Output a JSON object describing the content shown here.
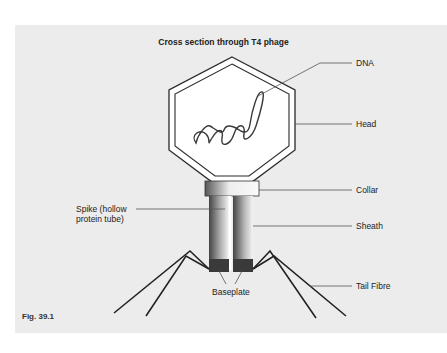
{
  "figure": {
    "title": "Cross section through T4 phage",
    "caption": "Fig. 39.1"
  },
  "labels": {
    "dna": "DNA",
    "head": "Head",
    "collar": "Collar",
    "spike_line1": "Spike (hollow",
    "spike_line2": "protein tube)",
    "sheath": "Sheath",
    "baseplate": "Baseplate",
    "tail_fibre": "Tail Fibre"
  },
  "colors": {
    "panel": "#ececec",
    "outline": "#2a2a2a",
    "baseplate": "#3a3a3a"
  }
}
